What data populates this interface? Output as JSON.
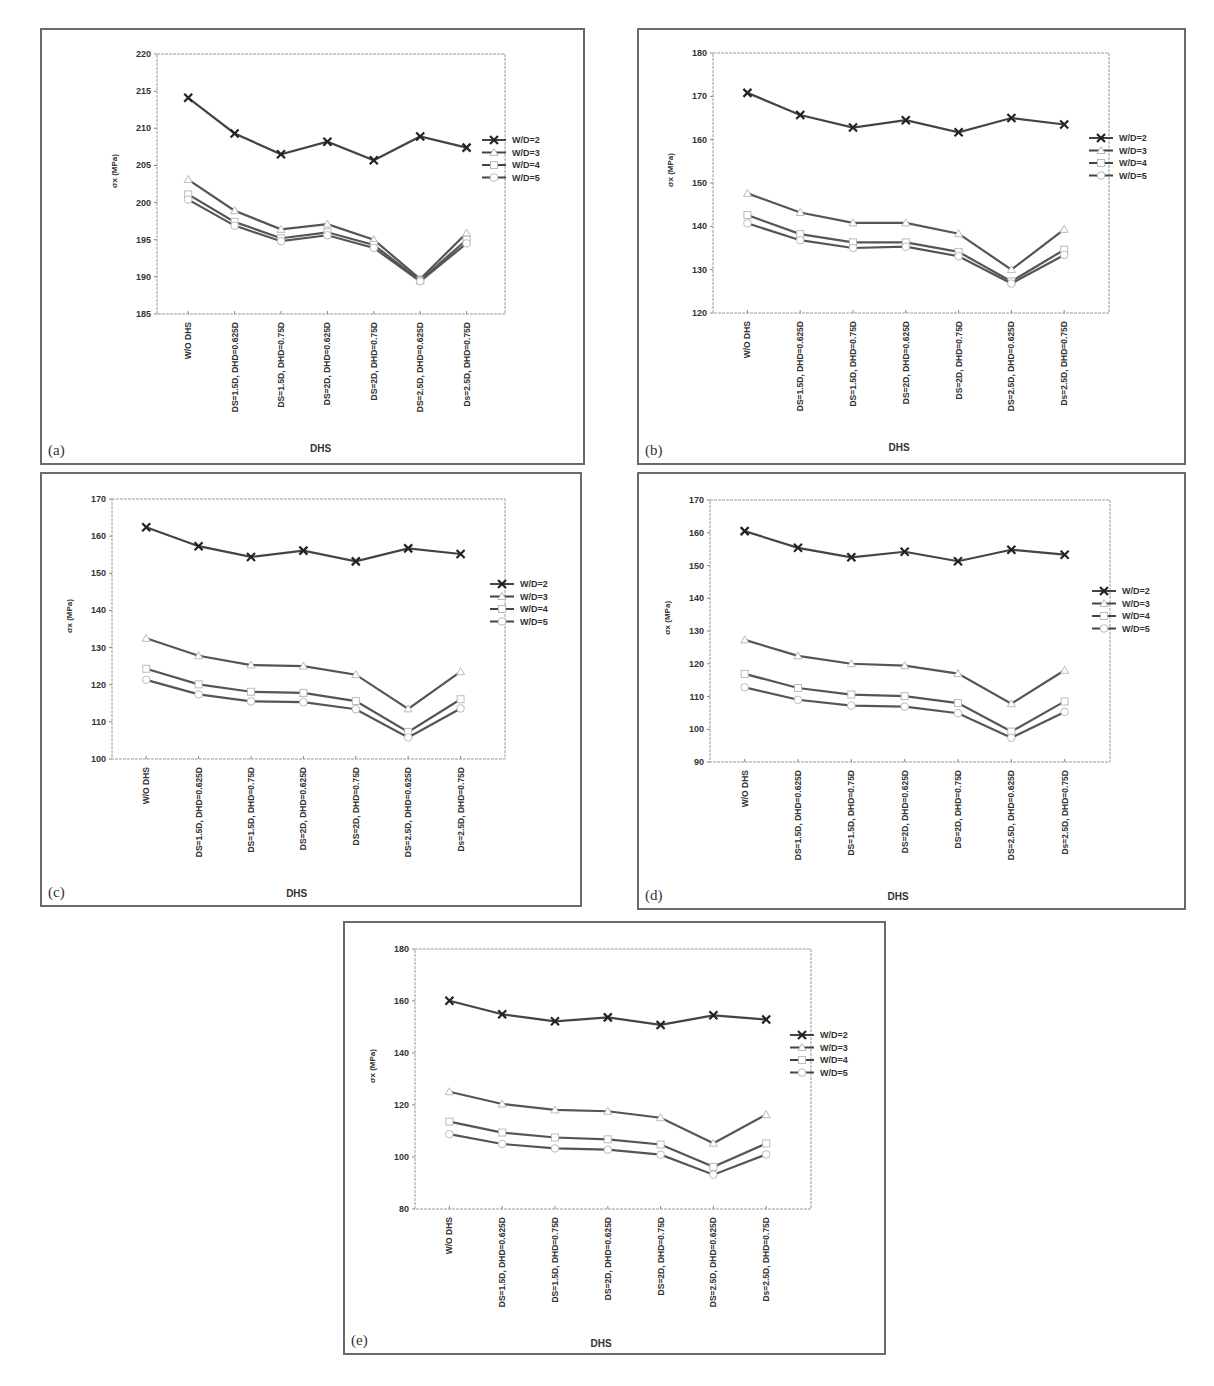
{
  "figure": {
    "common": {
      "xlabel": "DHS",
      "ylabel": "σx (MPa)",
      "categories": [
        "W/O DHS",
        "DS=1.5D, DHD=0.625D",
        "DS=1.5D, DHD=0.75D",
        "DS=2D, DHD=0.625D",
        "DS=2D, DHD=0.75D",
        "DS=2.5D, DHD=0.625D",
        "Ds=2.5D, DHD=0.75D"
      ],
      "legend": [
        "W/D=2",
        "W/D=3",
        "W/D=4",
        "W/D=5"
      ]
    }
  },
  "chart_data": [
    {
      "panel": "(a)",
      "type": "line",
      "xlabel": "DHS",
      "ylabel": "σx (MPa)",
      "ylim": [
        185,
        220
      ],
      "yticks": [
        185,
        190,
        195,
        200,
        205,
        210,
        215,
        220
      ],
      "categories": [
        "W/O DHS",
        "DS=1.5D, DHD=0.625D",
        "DS=1.5D, DHD=0.75D",
        "DS=2D, DHD=0.625D",
        "DS=2D, DHD=0.75D",
        "DS=2.5D, DHD=0.625D",
        "Ds=2.5D, DHD=0.75D"
      ],
      "legend_position": "right",
      "series": [
        {
          "name": "W/D=2",
          "marker": "x",
          "values": [
            214.1,
            209.3,
            206.5,
            208.2,
            205.7,
            208.9,
            207.4
          ]
        },
        {
          "name": "W/D=3",
          "marker": "triangle",
          "values": [
            203.1,
            198.9,
            196.4,
            197.1,
            195.0,
            189.7,
            195.9
          ]
        },
        {
          "name": "W/D=4",
          "marker": "square",
          "values": [
            201.1,
            197.4,
            195.2,
            196.0,
            194.3,
            189.5,
            195.0
          ]
        },
        {
          "name": "W/D=5",
          "marker": "circle",
          "values": [
            200.4,
            196.9,
            194.8,
            195.6,
            193.9,
            189.4,
            194.5
          ]
        }
      ]
    },
    {
      "panel": "(b)",
      "type": "line",
      "xlabel": "DHS",
      "ylabel": "σx (MPa)",
      "ylim": [
        120,
        180
      ],
      "yticks": [
        120,
        130,
        140,
        150,
        160,
        170,
        180
      ],
      "categories": [
        "W/O DHS",
        "DS=1.5D, DHD=0.625D",
        "DS=1.5D, DHD=0.75D",
        "DS=2D, DHD=0.625D",
        "DS=2D, DHD=0.75D",
        "DS=2.5D, DHD=0.625D",
        "Ds=2.5D, DHD=0.75D"
      ],
      "legend_position": "right",
      "series": [
        {
          "name": "W/D=2",
          "marker": "x",
          "values": [
            170.8,
            165.7,
            162.8,
            164.5,
            161.7,
            165.0,
            163.5
          ]
        },
        {
          "name": "W/D=3",
          "marker": "triangle",
          "values": [
            147.6,
            143.2,
            140.8,
            140.8,
            138.3,
            130.0,
            139.3
          ]
        },
        {
          "name": "W/D=4",
          "marker": "square",
          "values": [
            142.6,
            138.2,
            136.3,
            136.3,
            134.1,
            127.3,
            134.6
          ]
        },
        {
          "name": "W/D=5",
          "marker": "circle",
          "values": [
            140.7,
            136.8,
            135.0,
            135.3,
            133.1,
            126.8,
            133.4
          ]
        }
      ]
    },
    {
      "panel": "(c)",
      "type": "line",
      "xlabel": "DHS",
      "ylabel": "σx (MPa)",
      "ylim": [
        100,
        170
      ],
      "yticks": [
        100,
        110,
        120,
        130,
        140,
        150,
        160,
        170
      ],
      "categories": [
        "W/O DHS",
        "DS=1.5D, DHD=0.625D",
        "DS=1.5D, DHD=0.75D",
        "DS=2D, DHD=0.625D",
        "DS=2D, DHD=0.75D",
        "DS=2.5D, DHD=0.625D",
        "Ds=2.5D, DHD=0.75D"
      ],
      "legend_position": "right",
      "series": [
        {
          "name": "W/D=2",
          "marker": "x",
          "values": [
            162.4,
            157.3,
            154.4,
            156.1,
            153.2,
            156.7,
            155.2
          ]
        },
        {
          "name": "W/D=3",
          "marker": "triangle",
          "values": [
            132.5,
            127.8,
            125.3,
            125.0,
            122.7,
            113.5,
            123.5
          ]
        },
        {
          "name": "W/D=4",
          "marker": "square",
          "values": [
            124.3,
            120.1,
            118.1,
            117.8,
            115.6,
            107.3,
            116.1
          ]
        },
        {
          "name": "W/D=5",
          "marker": "circle",
          "values": [
            121.3,
            117.4,
            115.5,
            115.3,
            113.4,
            105.8,
            113.6
          ]
        }
      ]
    },
    {
      "panel": "(d)",
      "type": "line",
      "xlabel": "DHS",
      "ylabel": "σx (MPa)",
      "ylim": [
        90,
        170
      ],
      "yticks": [
        90,
        100,
        110,
        120,
        130,
        140,
        150,
        160,
        170
      ],
      "categories": [
        "W/O DHS",
        "DS=1.5D, DHD=0.625D",
        "DS=1.5D, DHD=0.75D",
        "DS=2D, DHD=0.625D",
        "DS=2D, DHD=0.75D",
        "DS=2.5D, DHD=0.625D",
        "Ds=2.5D, DHD=0.75D"
      ],
      "legend_position": "right",
      "series": [
        {
          "name": "W/D=2",
          "marker": "x",
          "values": [
            160.5,
            155.4,
            152.5,
            154.2,
            151.3,
            154.8,
            153.3
          ]
        },
        {
          "name": "W/D=3",
          "marker": "triangle",
          "values": [
            127.3,
            122.4,
            120.0,
            119.4,
            117.0,
            107.8,
            118.0
          ]
        },
        {
          "name": "W/D=4",
          "marker": "square",
          "values": [
            116.9,
            112.6,
            110.6,
            110.1,
            108.0,
            99.3,
            108.5
          ]
        },
        {
          "name": "W/D=5",
          "marker": "circle",
          "values": [
            112.8,
            109.0,
            107.2,
            106.9,
            104.9,
            97.4,
            105.3
          ]
        }
      ]
    },
    {
      "panel": "(e)",
      "type": "line",
      "xlabel": "DHS",
      "ylabel": "σx (MPa)",
      "ylim": [
        80,
        180
      ],
      "yticks": [
        80,
        100,
        120,
        140,
        160,
        180
      ],
      "categories": [
        "W/O DHS",
        "DS=1.5D, DHD=0.625D",
        "DS=1.5D, DHD=0.75D",
        "DS=2D, DHD=0.625D",
        "DS=2D, DHD=0.75D",
        "DS=2.5D, DHD=0.625D",
        "Ds=2.5D, DHD=0.75D"
      ],
      "legend_position": "right",
      "series": [
        {
          "name": "W/D=2",
          "marker": "x",
          "values": [
            160.1,
            154.9,
            152.2,
            153.7,
            150.8,
            154.5,
            152.9
          ]
        },
        {
          "name": "W/D=3",
          "marker": "triangle",
          "values": [
            125.1,
            120.4,
            118.1,
            117.6,
            115.1,
            105.3,
            116.3
          ]
        },
        {
          "name": "W/D=4",
          "marker": "square",
          "values": [
            113.6,
            109.4,
            107.5,
            106.8,
            104.8,
            96.2,
            105.2
          ]
        },
        {
          "name": "W/D=5",
          "marker": "circle",
          "values": [
            108.8,
            105.0,
            103.3,
            102.8,
            100.9,
            93.2,
            101.0
          ]
        }
      ]
    }
  ],
  "panels": [
    {
      "label": "(a)"
    },
    {
      "label": "(b)"
    },
    {
      "label": "(c)"
    },
    {
      "label": "(d)"
    },
    {
      "label": "(e)"
    }
  ]
}
